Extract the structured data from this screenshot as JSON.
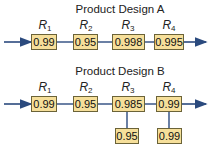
{
  "colors": {
    "line": "#2b4a7e",
    "box_fill": "#f6df9a",
    "box_border": "#6b6338"
  },
  "designA": {
    "title": "Product Design A",
    "components": [
      {
        "label": "R",
        "sub": "1",
        "value": "0.99"
      },
      {
        "label": "R",
        "sub": "2",
        "value": "0.95"
      },
      {
        "label": "R",
        "sub": "3",
        "value": "0.998"
      },
      {
        "label": "R",
        "sub": "4",
        "value": "0.995"
      }
    ]
  },
  "designB": {
    "title": "Product Design B",
    "components": [
      {
        "label": "R",
        "sub": "1",
        "value": "0.99"
      },
      {
        "label": "R",
        "sub": "2",
        "value": "0.95"
      },
      {
        "label": "R",
        "sub": "3",
        "value": "0.985",
        "backup": "0.95"
      },
      {
        "label": "R",
        "sub": "4",
        "value": "0.99",
        "backup": "0.99"
      }
    ]
  }
}
